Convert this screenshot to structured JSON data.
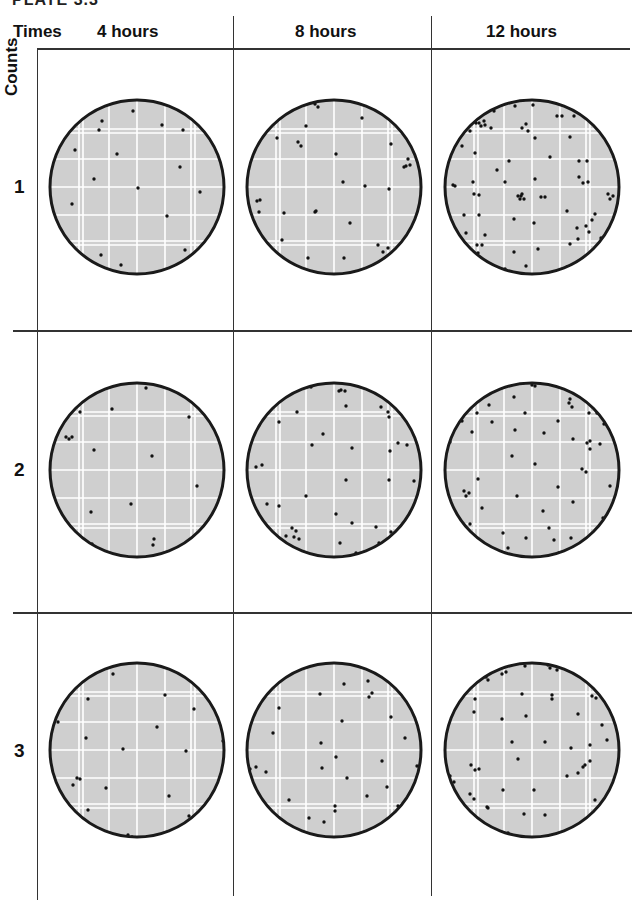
{
  "figure": {
    "title_partial": "PLATE 3.3",
    "corner_header": "Times",
    "row_axis_label": "Counts",
    "columns": [
      {
        "label": "4 hours"
      },
      {
        "label": "8 hours"
      },
      {
        "label": "12 hours"
      }
    ],
    "rows": [
      {
        "label": "1"
      },
      {
        "label": "2"
      },
      {
        "label": "3"
      }
    ],
    "colors": {
      "agar": "#cfcfcf",
      "grid_line": "#ffffff",
      "rim": "#1a1a1a",
      "colony": "#111111",
      "divider": "#333333"
    }
  },
  "plates": [
    {
      "row": 1,
      "column": "4 hours",
      "colony_count_visible": 17,
      "colonies": [
        [
          -4,
          -76
        ],
        [
          -35,
          -66
        ],
        [
          25,
          -62
        ],
        [
          -38,
          -57
        ],
        [
          46,
          -57
        ],
        [
          -62,
          -37
        ],
        [
          -20,
          -33
        ],
        [
          43,
          -20
        ],
        [
          -43,
          -8
        ],
        [
          1,
          1
        ],
        [
          63,
          5
        ],
        [
          -65,
          17
        ],
        [
          30,
          29
        ],
        [
          -36,
          68
        ],
        [
          48,
          63
        ],
        [
          -16,
          78
        ],
        [
          27,
          84
        ]
      ]
    },
    {
      "row": 1,
      "column": "8 hours",
      "colony_count_visible": 32,
      "colonies": [
        [
          -19,
          -83
        ],
        [
          -16,
          -80
        ],
        [
          28,
          -69
        ],
        [
          -28,
          -61
        ],
        [
          -57,
          -49
        ],
        [
          -36,
          -45
        ],
        [
          -33,
          -41
        ],
        [
          2,
          -33
        ],
        [
          57,
          -43
        ],
        [
          74,
          -28
        ],
        [
          70,
          -20
        ],
        [
          72,
          -21
        ],
        [
          76,
          -22
        ],
        [
          9,
          -5
        ],
        [
          31,
          -1
        ],
        [
          55,
          2
        ],
        [
          -77,
          14
        ],
        [
          -74,
          13
        ],
        [
          -75,
          25
        ],
        [
          -50,
          26
        ],
        [
          -19,
          25
        ],
        [
          -18,
          24
        ],
        [
          16,
          36
        ],
        [
          -52,
          53
        ],
        [
          44,
          58
        ],
        [
          54,
          61
        ],
        [
          49,
          65
        ],
        [
          -26,
          71
        ],
        [
          10,
          71
        ],
        [
          -3,
          91
        ]
      ]
    },
    {
      "row": 1,
      "column": "12 hours",
      "colony_count_visible": 72,
      "colonies": [
        [
          -17,
          -81
        ],
        [
          1,
          -82
        ],
        [
          -38,
          -76
        ],
        [
          25,
          -71
        ],
        [
          30,
          -71
        ],
        [
          -53,
          -64
        ],
        [
          -48,
          -66
        ],
        [
          -51,
          -61
        ],
        [
          -41,
          -59
        ],
        [
          -47,
          -62
        ],
        [
          -6,
          -63
        ],
        [
          -10,
          -59
        ],
        [
          -4,
          -56
        ],
        [
          3,
          -49
        ],
        [
          38,
          -50
        ],
        [
          -70,
          -41
        ],
        [
          -57,
          -34
        ],
        [
          -23,
          -26
        ],
        [
          18,
          -30
        ],
        [
          47,
          -26
        ],
        [
          55,
          -26
        ],
        [
          -35,
          -17
        ],
        [
          -79,
          -2
        ],
        [
          -77,
          -1
        ],
        [
          -59,
          -5
        ],
        [
          -27,
          -5
        ],
        [
          3,
          -8
        ],
        [
          47,
          -10
        ],
        [
          56,
          -5
        ],
        [
          -58,
          7
        ],
        [
          -53,
          8
        ],
        [
          -11,
          9
        ],
        [
          -8,
          12
        ],
        [
          -12,
          12
        ],
        [
          -14,
          9
        ],
        [
          -10,
          7
        ],
        [
          9,
          10
        ],
        [
          13,
          10
        ],
        [
          76,
          7
        ],
        [
          81,
          9
        ],
        [
          78,
          12
        ],
        [
          -53,
          28
        ],
        [
          -68,
          28
        ],
        [
          -18,
          32
        ],
        [
          35,
          24
        ],
        [
          63,
          27
        ],
        [
          2,
          36
        ],
        [
          -66,
          46
        ],
        [
          -47,
          48
        ],
        [
          45,
          41
        ],
        [
          54,
          39
        ],
        [
          57,
          45
        ],
        [
          46,
          52
        ],
        [
          69,
          51
        ],
        [
          -50,
          58
        ],
        [
          -55,
          58
        ],
        [
          -54,
          66
        ],
        [
          -52,
          72
        ],
        [
          -18,
          65
        ],
        [
          6,
          62
        ],
        [
          38,
          57
        ],
        [
          63,
          66
        ],
        [
          -6,
          79
        ],
        [
          35,
          80
        ],
        [
          -27,
          82
        ],
        [
          -24,
          85
        ],
        [
          11,
          92
        ],
        [
          -56,
          -64
        ],
        [
          42,
          -71
        ],
        [
          -62,
          -56
        ],
        [
          51,
          -4
        ],
        [
          60,
          33
        ]
      ]
    },
    {
      "row": 2,
      "column": "4 hours",
      "colony_count_visible": 17,
      "colonies": [
        [
          9,
          -82
        ],
        [
          -57,
          -58
        ],
        [
          -25,
          -61
        ],
        [
          52,
          -53
        ],
        [
          -71,
          -33
        ],
        [
          -65,
          -33
        ],
        [
          -43,
          -20
        ],
        [
          15,
          -14
        ],
        [
          60,
          16
        ],
        [
          -6,
          34
        ],
        [
          -46,
          42
        ],
        [
          80,
          43
        ],
        [
          17,
          69
        ],
        [
          16,
          75
        ],
        [
          -45,
          74
        ],
        [
          -8,
          93
        ],
        [
          -68,
          -31
        ]
      ]
    },
    {
      "row": 2,
      "column": "8 hours",
      "colony_count_visible": 50,
      "colonies": [
        [
          -47,
          -93
        ],
        [
          -44,
          -91
        ],
        [
          -23,
          -83
        ],
        [
          5,
          -79
        ],
        [
          11,
          -79
        ],
        [
          7,
          -80
        ],
        [
          51,
          -84
        ],
        [
          54,
          -58
        ],
        [
          -37,
          -58
        ],
        [
          12,
          -64
        ],
        [
          47,
          -63
        ],
        [
          55,
          -53
        ],
        [
          -72,
          -53
        ],
        [
          -55,
          -48
        ],
        [
          -11,
          -36
        ],
        [
          -22,
          -25
        ],
        [
          18,
          -22
        ],
        [
          56,
          -19
        ],
        [
          64,
          -27
        ],
        [
          73,
          -25
        ],
        [
          -78,
          -3
        ],
        [
          -72,
          -5
        ],
        [
          12,
          10
        ],
        [
          55,
          10
        ],
        [
          80,
          11
        ],
        [
          -28,
          26
        ],
        [
          -67,
          34
        ],
        [
          -55,
          36
        ],
        [
          2,
          44
        ],
        [
          18,
          53
        ],
        [
          42,
          57
        ],
        [
          57,
          62
        ],
        [
          45,
          73
        ],
        [
          -48,
          66
        ],
        [
          -40,
          67
        ],
        [
          -35,
          69
        ],
        [
          -42,
          58
        ],
        [
          -38,
          61
        ],
        [
          6,
          73
        ],
        [
          22,
          83
        ],
        [
          -25,
          89
        ],
        [
          33,
          90
        ],
        [
          -75,
          -45
        ],
        [
          -47,
          -86
        ]
      ]
    },
    {
      "row": 2,
      "column": "12 hours",
      "colony_count_visible": 72,
      "colonies": [
        [
          0,
          -85
        ],
        [
          3,
          -84
        ],
        [
          -18,
          -73
        ],
        [
          -43,
          -65
        ],
        [
          38,
          -71
        ],
        [
          37,
          -67
        ],
        [
          40,
          -63
        ],
        [
          -7,
          -57
        ],
        [
          57,
          -57
        ],
        [
          -55,
          -57
        ],
        [
          -70,
          -49
        ],
        [
          -40,
          -48
        ],
        [
          26,
          -49
        ],
        [
          72,
          -46
        ],
        [
          -60,
          -38
        ],
        [
          -17,
          -40
        ],
        [
          12,
          -37
        ],
        [
          68,
          -26
        ],
        [
          41,
          -31
        ],
        [
          -82,
          -28
        ],
        [
          55,
          -27
        ],
        [
          58,
          -29
        ],
        [
          58,
          -21
        ],
        [
          -20,
          -14
        ],
        [
          3,
          -6
        ],
        [
          50,
          -1
        ],
        [
          54,
          2
        ],
        [
          -54,
          9
        ],
        [
          26,
          17
        ],
        [
          78,
          16
        ],
        [
          -68,
          21
        ],
        [
          -66,
          26
        ],
        [
          -63,
          23
        ],
        [
          -15,
          26
        ],
        [
          41,
          32
        ],
        [
          -50,
          38
        ],
        [
          11,
          41
        ],
        [
          -85,
          40
        ],
        [
          71,
          48
        ],
        [
          -29,
          63
        ],
        [
          -6,
          68
        ],
        [
          -62,
          54
        ],
        [
          -49,
          75
        ],
        [
          27,
          83
        ],
        [
          39,
          68
        ],
        [
          57,
          67
        ],
        [
          78,
          74
        ],
        [
          -57,
          81
        ],
        [
          -53,
          85
        ],
        [
          -33,
          97
        ],
        [
          -16,
          106
        ],
        [
          3,
          112
        ],
        [
          17,
          58
        ],
        [
          22,
          70
        ],
        [
          -24,
          78
        ],
        [
          65,
          -57
        ]
      ]
    },
    {
      "row": 3,
      "column": "4 hours",
      "colony_count_visible": 20,
      "colonies": [
        [
          -24,
          -76
        ],
        [
          28,
          -55
        ],
        [
          -49,
          -51
        ],
        [
          57,
          -41
        ],
        [
          20,
          -23
        ],
        [
          -79,
          -28
        ],
        [
          -51,
          -12
        ],
        [
          -14,
          -1
        ],
        [
          86,
          -9
        ],
        [
          49,
          1
        ],
        [
          -60,
          28
        ],
        [
          -57,
          29
        ],
        [
          -64,
          35
        ],
        [
          -31,
          38
        ],
        [
          32,
          46
        ],
        [
          -49,
          60
        ],
        [
          52,
          66
        ],
        [
          -9,
          85
        ],
        [
          -5,
          87
        ],
        [
          -12,
          90
        ]
      ]
    },
    {
      "row": 3,
      "column": "8 hours",
      "colony_count_visible": 38,
      "colonies": [
        [
          -47,
          -83
        ],
        [
          -44,
          -82
        ],
        [
          10,
          -66
        ],
        [
          34,
          -69
        ],
        [
          38,
          -57
        ],
        [
          35,
          -53
        ],
        [
          -14,
          -56
        ],
        [
          -55,
          -42
        ],
        [
          57,
          -33
        ],
        [
          8,
          -29
        ],
        [
          71,
          -12
        ],
        [
          -13,
          -7
        ],
        [
          -61,
          -17
        ],
        [
          2,
          7
        ],
        [
          48,
          11
        ],
        [
          -84,
          19
        ],
        [
          -68,
          22
        ],
        [
          -12,
          18
        ],
        [
          13,
          28
        ],
        [
          53,
          37
        ],
        [
          -45,
          50
        ],
        [
          33,
          46
        ],
        [
          64,
          56
        ],
        [
          1,
          56
        ],
        [
          1,
          61
        ],
        [
          -55,
          68
        ],
        [
          -25,
          68
        ],
        [
          -10,
          72
        ],
        [
          58,
          68
        ],
        [
          83,
          16
        ],
        [
          -78,
          17
        ]
      ]
    },
    {
      "row": 3,
      "column": "12 hours",
      "colony_count_visible": 80,
      "colonies": [
        [
          -7,
          -84
        ],
        [
          16,
          -85
        ],
        [
          18,
          -82
        ],
        [
          25,
          -80
        ],
        [
          -50,
          -76
        ],
        [
          -47,
          -79
        ],
        [
          -30,
          -76
        ],
        [
          -26,
          -78
        ],
        [
          -10,
          -56
        ],
        [
          20,
          -55
        ],
        [
          20,
          -51
        ],
        [
          -57,
          -51
        ],
        [
          60,
          -54
        ],
        [
          64,
          -52
        ],
        [
          -30,
          -31
        ],
        [
          -6,
          -34
        ],
        [
          46,
          -36
        ],
        [
          70,
          -25
        ],
        [
          -58,
          -38
        ],
        [
          -20,
          -8
        ],
        [
          13,
          -8
        ],
        [
          39,
          -2
        ],
        [
          58,
          -5
        ],
        [
          75,
          -10
        ],
        [
          -61,
          15
        ],
        [
          -57,
          20
        ],
        [
          -53,
          19
        ],
        [
          51,
          17
        ],
        [
          53,
          15
        ],
        [
          46,
          23
        ],
        [
          58,
          11
        ],
        [
          35,
          26
        ],
        [
          -14,
          9
        ],
        [
          -82,
          26
        ],
        [
          -78,
          32
        ],
        [
          2,
          40
        ],
        [
          -29,
          40
        ],
        [
          84,
          42
        ],
        [
          80,
          47
        ],
        [
          -62,
          44
        ],
        [
          -58,
          49
        ],
        [
          63,
          50
        ],
        [
          -8,
          64
        ],
        [
          -45,
          57
        ],
        [
          -44,
          58
        ],
        [
          13,
          65
        ],
        [
          -84,
          56
        ],
        [
          -67,
          67
        ],
        [
          -57,
          77
        ],
        [
          -55,
          81
        ],
        [
          -53,
          87
        ],
        [
          -24,
          83
        ],
        [
          -26,
          86
        ],
        [
          -31,
          89
        ],
        [
          33,
          83
        ],
        [
          46,
          76
        ],
        [
          53,
          83
        ],
        [
          55,
          80
        ],
        [
          5,
          90
        ],
        [
          -34,
          102
        ],
        [
          -46,
          97
        ],
        [
          21,
          93
        ],
        [
          26,
          97
        ],
        [
          -3,
          109
        ],
        [
          -80,
          75
        ],
        [
          -76,
          76
        ],
        [
          78,
          64
        ],
        [
          84,
          64
        ],
        [
          -46,
          -73
        ],
        [
          -44,
          -70
        ]
      ]
    }
  ]
}
